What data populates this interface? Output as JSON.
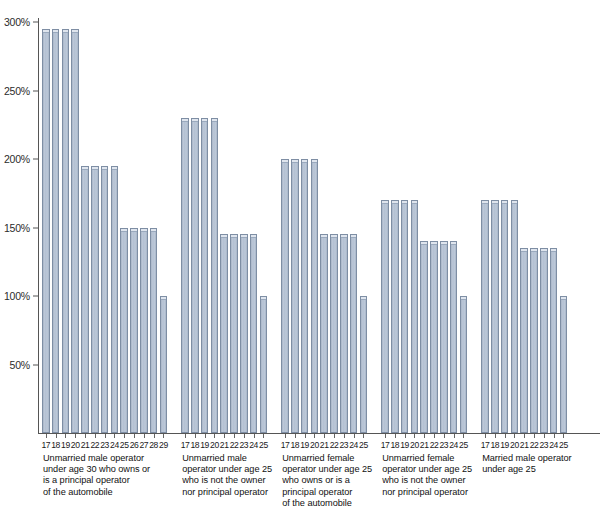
{
  "chart_data": {
    "type": "bar",
    "title": "",
    "subtitle": "",
    "xlabel": "",
    "ylabel": "",
    "ylim": [
      0,
      310
    ],
    "grid": false,
    "legend": "none",
    "y_ticks": [
      50,
      100,
      150,
      200,
      250,
      300
    ],
    "y_tick_labels": [
      "50%",
      "100%",
      "150%",
      "200%",
      "250%",
      "300%"
    ],
    "value_unit": "percent",
    "groups": [
      {
        "id": "group-1",
        "caption": "Unmarried male operator\nunder age 30 who owns or\nis a principal operator\nof the automobile",
        "categories": [
          "17",
          "18",
          "19",
          "20",
          "21",
          "22",
          "23",
          "24",
          "25",
          "26",
          "27",
          "28",
          "29"
        ],
        "values": [
          295,
          295,
          295,
          295,
          195,
          195,
          195,
          195,
          150,
          150,
          150,
          150,
          100
        ]
      },
      {
        "id": "group-2",
        "caption": "Unmarried male\noperator under age 25\nwho is not the owner\nnor principal operator",
        "categories": [
          "17",
          "18",
          "19",
          "20",
          "21",
          "22",
          "23",
          "24",
          "25"
        ],
        "values": [
          230,
          230,
          230,
          230,
          145,
          145,
          145,
          145,
          100
        ]
      },
      {
        "id": "group-3",
        "caption": "Unmarried female\noperator under age 25\nwho owns or is a\nprincipal operator\nof the automobile",
        "categories": [
          "17",
          "18",
          "19",
          "20",
          "21",
          "22",
          "23",
          "24",
          "25"
        ],
        "values": [
          200,
          200,
          200,
          200,
          145,
          145,
          145,
          145,
          100
        ]
      },
      {
        "id": "group-4",
        "caption": "Unmarried female\noperator under age 25\nwho is not the owner\nnor principal operator",
        "categories": [
          "17",
          "18",
          "19",
          "20",
          "21",
          "22",
          "23",
          "24",
          "25"
        ],
        "values": [
          170,
          170,
          170,
          170,
          140,
          140,
          140,
          140,
          100
        ]
      },
      {
        "id": "group-5",
        "caption": "Married male operator\nunder age 25",
        "categories": [
          "17",
          "18",
          "19",
          "20",
          "21",
          "22",
          "23",
          "24",
          "25"
        ],
        "values": [
          170,
          170,
          170,
          170,
          135,
          135,
          135,
          135,
          100
        ]
      }
    ],
    "colors": {
      "bar_fill": "#b3c0d2",
      "bar_edge": "#7e8ea4",
      "bar_highlight": "#dfe5ee",
      "axis": "#555555",
      "text": "#1a1a1a",
      "background": "#ffffff"
    }
  }
}
